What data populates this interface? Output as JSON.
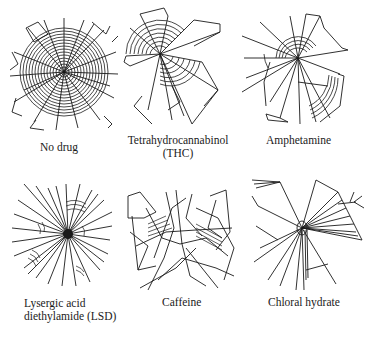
{
  "figure": {
    "panels": [
      {
        "id": "no-drug",
        "label_lines": [
          "No drug"
        ],
        "web_style": "dense-orb"
      },
      {
        "id": "thc",
        "label_lines": [
          "Tetrahydrocannabinol",
          "(THC)"
        ],
        "web_style": "partial-orb-sectors"
      },
      {
        "id": "amphetamine",
        "label_lines": [
          "Amphetamine"
        ],
        "web_style": "irregular-spiral-arcs"
      },
      {
        "id": "lsd",
        "label_lines": [
          "Lysergic acid",
          "diethylamide (LSD)"
        ],
        "web_style": "radial-spokes"
      },
      {
        "id": "caffeine",
        "label_lines": [
          "Caffeine"
        ],
        "web_style": "chaotic-lines"
      },
      {
        "id": "chloral-hydrate",
        "label_lines": [
          "Chloral hydrate"
        ],
        "web_style": "sparse-radial"
      }
    ],
    "line_color": "#1a1a1a",
    "background": "#ffffff"
  }
}
